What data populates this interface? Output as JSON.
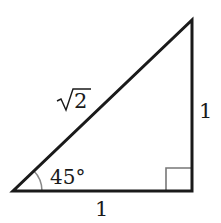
{
  "diagram": {
    "type": "right-triangle",
    "vertices": {
      "bottom_left": [
        13,
        191
      ],
      "bottom_right": [
        192,
        191
      ],
      "top_right": [
        192,
        20
      ]
    },
    "labels": {
      "hypotenuse": "√2",
      "hypotenuse_radicand": "2",
      "vertical_leg": "1",
      "horizontal_leg": "1",
      "angle": "45°"
    },
    "colors": {
      "stroke": "#1a1a1a",
      "right_angle_marker": "#777777",
      "angle_arc": "#888888",
      "background": "#ffffff"
    }
  }
}
